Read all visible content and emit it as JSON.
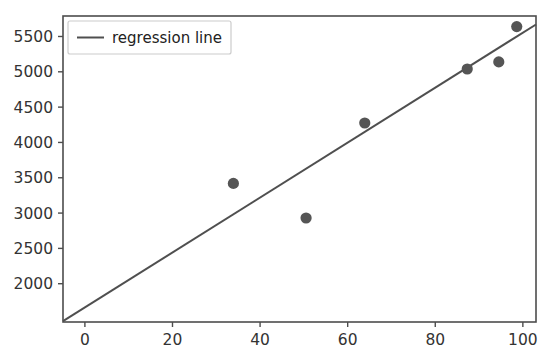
{
  "chart_data": {
    "type": "scatter",
    "title": "",
    "xlabel": "",
    "ylabel": "",
    "xlim": [
      -5.0,
      103.0
    ],
    "ylim": [
      1458,
      5790
    ],
    "grid": false,
    "legend_position": "upper left",
    "xticks": [
      0,
      20,
      40,
      60,
      80,
      100
    ],
    "xtick_labels": [
      "0",
      "20",
      "40",
      "60",
      "80",
      "100"
    ],
    "yticks": [
      2000,
      2500,
      3000,
      3500,
      4000,
      4500,
      5000,
      5500
    ],
    "ytick_labels": [
      "2000",
      "2500",
      "3000",
      "3500",
      "4000",
      "4500",
      "5000",
      "5500"
    ],
    "series": [
      {
        "name": "data points",
        "kind": "scatter",
        "marker": "o",
        "color": "#555555",
        "x": [
          33.9,
          50.5,
          63.9,
          87.3,
          94.5,
          98.6
        ],
        "y": [
          3420,
          2930,
          4275,
          5040,
          5140,
          5640
        ]
      },
      {
        "name": "regression line",
        "kind": "line",
        "color": "#4f4f4f",
        "x": [
          -5.0,
          103.0
        ],
        "y": [
          1470,
          5670
        ]
      }
    ],
    "legend_entries": [
      {
        "label": "regression line",
        "color": "#4f4f4f",
        "kind": "line"
      }
    ]
  },
  "figure": {
    "background_color": "#ffffff",
    "axis_color": "#4d4d4d",
    "tick_color": "#333333",
    "point_color": "#555555",
    "line_color": "#4f4f4f"
  }
}
